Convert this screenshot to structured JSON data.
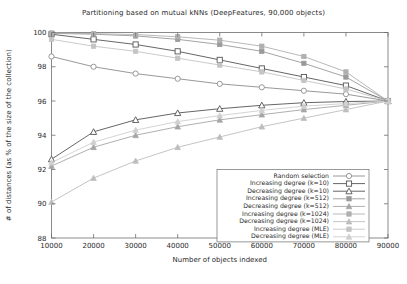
{
  "chart_data": {
    "type": "line",
    "title": "Partitioning based on mutual kNNs (DeepFeatures, 90,000 objects)",
    "xlabel": "Number of objects indexed",
    "ylabel": "# of distances (as % of the size of the collection)",
    "xlim": [
      10000,
      90000
    ],
    "ylim": [
      88,
      100
    ],
    "xticks": [
      10000,
      20000,
      30000,
      40000,
      50000,
      60000,
      70000,
      80000,
      90000
    ],
    "xtick_labels": [
      "10000",
      "20000",
      "30000",
      "40000",
      "50000",
      "60000",
      "70000",
      "80000",
      "90000"
    ],
    "yticks": [
      88,
      90,
      92,
      94,
      96,
      98,
      100
    ],
    "ytick_labels": [
      "88",
      "90",
      "92",
      "94",
      "96",
      "98",
      "100"
    ],
    "grid": false,
    "legend_position": "bottom-right",
    "x": [
      10000,
      20000,
      30000,
      40000,
      50000,
      60000,
      70000,
      80000,
      90000
    ],
    "series": [
      {
        "name": "Random selection",
        "marker": "open-circle",
        "color": "#8d8d8d",
        "values": [
          98.6,
          98.0,
          97.6,
          97.3,
          97.0,
          96.8,
          96.6,
          96.4,
          96.0
        ]
      },
      {
        "name": "Increasing degree (k=10)",
        "marker": "open-square",
        "color": "#555555",
        "values": [
          99.9,
          99.6,
          99.3,
          98.9,
          98.4,
          97.9,
          97.4,
          96.9,
          96.0
        ]
      },
      {
        "name": "Decreasing degree (k=10)",
        "marker": "open-triangle",
        "color": "#555555",
        "values": [
          92.6,
          94.2,
          94.9,
          95.3,
          95.55,
          95.75,
          95.9,
          95.97,
          96.0
        ]
      },
      {
        "name": "Increasing degree (k=512)",
        "marker": "filled-square",
        "color": "#9a9a9a",
        "values": [
          99.95,
          99.9,
          99.8,
          99.6,
          99.3,
          98.9,
          98.2,
          97.4,
          96.0
        ]
      },
      {
        "name": "Decreasing degree (k=512)",
        "marker": "filled-triangle",
        "color": "#a6a6a6",
        "values": [
          92.2,
          93.3,
          94.0,
          94.5,
          94.9,
          95.2,
          95.5,
          95.75,
          96.0
        ]
      },
      {
        "name": "Increasing degree (k=1024)",
        "marker": "filled-square",
        "color": "#b0b0b0",
        "values": [
          99.97,
          99.93,
          99.88,
          99.75,
          99.55,
          99.2,
          98.6,
          97.7,
          96.0
        ]
      },
      {
        "name": "Decreasing degree (k=1024)",
        "marker": "filled-triangle",
        "color": "#bdbdbd",
        "values": [
          90.1,
          91.5,
          92.5,
          93.3,
          93.9,
          94.5,
          95.0,
          95.5,
          96.0
        ]
      },
      {
        "name": "Increasing degree (MLE)",
        "marker": "filled-square",
        "color": "#c4c4c4",
        "values": [
          99.6,
          99.2,
          98.9,
          98.5,
          98.1,
          97.7,
          97.2,
          96.7,
          96.0
        ]
      },
      {
        "name": "Decreasing degree (MLE)",
        "marker": "filled-triangle",
        "color": "#cfcfcf",
        "values": [
          92.4,
          93.6,
          94.3,
          94.8,
          95.15,
          95.45,
          95.7,
          95.85,
          96.0
        ]
      }
    ]
  }
}
